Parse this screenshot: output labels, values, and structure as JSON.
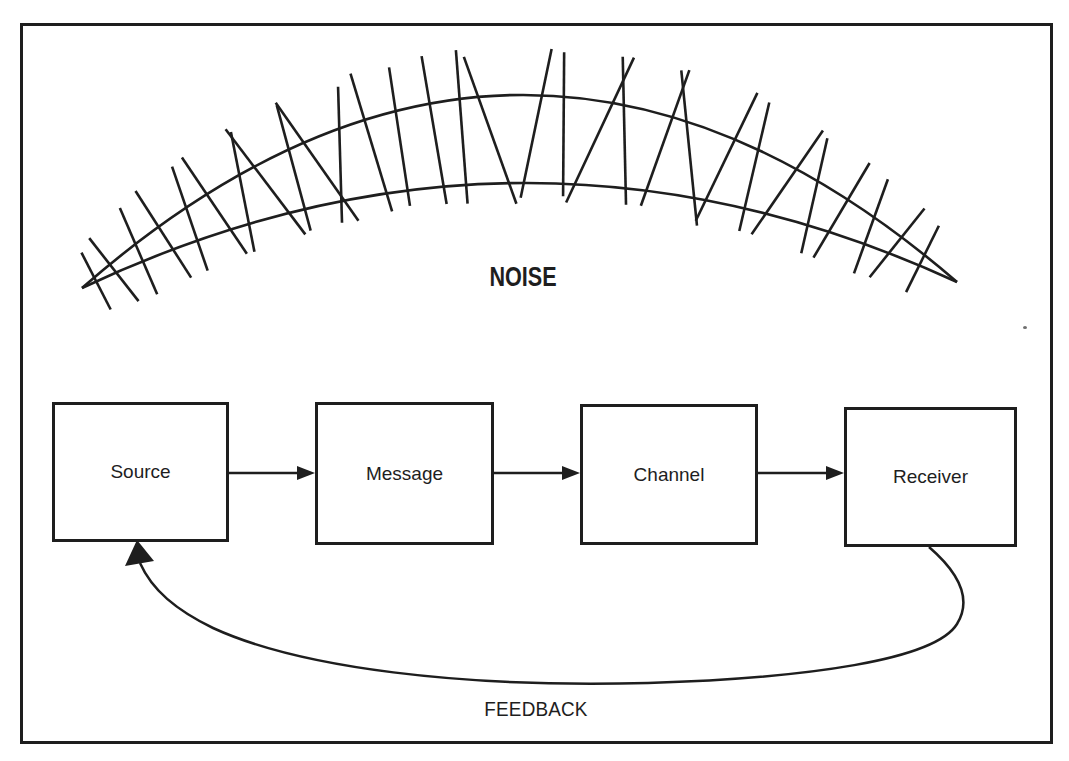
{
  "figure": {
    "noise_label": "NOISE",
    "feedback_label": "FEEDBACK",
    "boxes": [
      {
        "label": "Source"
      },
      {
        "label": "Message"
      },
      {
        "label": "Channel"
      },
      {
        "label": "Receiver"
      }
    ],
    "colors": {
      "ink": "#1e1e1e",
      "paper": "#ffffff"
    },
    "noise_arc": {
      "left_tip": [
        82,
        288
      ],
      "right_tip": [
        957,
        282
      ],
      "upper_ctrl": [
        520,
        -95
      ],
      "lower_ctrl": [
        520,
        81
      ],
      "hatches": [
        {
          "t": 0.015,
          "tilt": 6,
          "up": 30,
          "down": 34
        },
        {
          "t": 0.035,
          "tilt": -6,
          "up": 38,
          "down": 42
        },
        {
          "t": 0.065,
          "tilt": 7,
          "up": 48,
          "down": 46
        },
        {
          "t": 0.095,
          "tilt": -4,
          "up": 55,
          "down": 48
        },
        {
          "t": 0.125,
          "tilt": 8,
          "up": 60,
          "down": 50
        },
        {
          "t": 0.155,
          "tilt": -9,
          "up": 64,
          "down": 52
        },
        {
          "t": 0.185,
          "tilt": 12,
          "up": 68,
          "down": 54
        },
        {
          "t": 0.215,
          "tilt": -16,
          "up": 74,
          "down": 58
        },
        {
          "t": 0.245,
          "tilt": 4,
          "up": 76,
          "down": 54
        },
        {
          "t": 0.275,
          "tilt": -18,
          "up": 82,
          "down": 62
        },
        {
          "t": 0.295,
          "tilt": 14,
          "up": 78,
          "down": 58
        },
        {
          "t": 0.335,
          "tilt": -4,
          "up": 86,
          "down": 58
        },
        {
          "t": 0.365,
          "tilt": 2,
          "up": 84,
          "down": 56
        },
        {
          "t": 0.405,
          "tilt": -2,
          "up": 90,
          "down": 60
        },
        {
          "t": 0.435,
          "tilt": 1,
          "up": 92,
          "down": 62
        },
        {
          "t": 0.47,
          "tilt": -17,
          "up": 88,
          "down": 68
        },
        {
          "t": 0.515,
          "tilt": 11,
          "up": 92,
          "down": 60
        },
        {
          "t": 0.55,
          "tilt": -3,
          "up": 88,
          "down": 56
        },
        {
          "t": 0.585,
          "tilt": 19,
          "up": 94,
          "down": 66
        },
        {
          "t": 0.62,
          "tilt": -10,
          "up": 90,
          "down": 58
        },
        {
          "t": 0.66,
          "tilt": 8,
          "up": 88,
          "down": 56
        },
        {
          "t": 0.695,
          "tilt": -20,
          "up": 90,
          "down": 66
        },
        {
          "t": 0.73,
          "tilt": 9,
          "up": 84,
          "down": 58
        },
        {
          "t": 0.765,
          "tilt": -6,
          "up": 78,
          "down": 54
        },
        {
          "t": 0.8,
          "tilt": 13,
          "up": 72,
          "down": 54
        },
        {
          "t": 0.835,
          "tilt": -11,
          "up": 66,
          "down": 52
        },
        {
          "t": 0.865,
          "tilt": 5,
          "up": 60,
          "down": 50
        },
        {
          "t": 0.9,
          "tilt": -8,
          "up": 54,
          "down": 46
        },
        {
          "t": 0.93,
          "tilt": 9,
          "up": 46,
          "down": 42
        },
        {
          "t": 0.96,
          "tilt": -5,
          "up": 38,
          "down": 36
        }
      ]
    }
  }
}
